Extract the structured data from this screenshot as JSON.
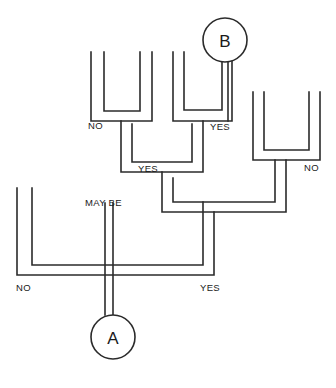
{
  "diagram": {
    "type": "decision-tree",
    "background_color": "#ffffff",
    "line_color": "#2b2b2b",
    "nodes": [
      {
        "id": "A",
        "label": "A",
        "cx": 113,
        "cy": 337,
        "r": 22
      },
      {
        "id": "B",
        "label": "B",
        "cx": 225,
        "cy": 40,
        "r": 22
      }
    ],
    "branch_labels": [
      {
        "id": "label-no-top-left",
        "text": "NO",
        "x": 88,
        "y": 129
      },
      {
        "id": "label-yes-top-right",
        "text": "YES",
        "x": 210,
        "y": 130
      },
      {
        "id": "label-yes-mid",
        "text": "YES",
        "x": 138,
        "y": 172
      },
      {
        "id": "label-no-mid-right",
        "text": "NO",
        "x": 304,
        "y": 171
      },
      {
        "id": "label-maybe",
        "text": "MAY BE",
        "x": 85,
        "y": 206
      },
      {
        "id": "label-no-bottom",
        "text": "NO",
        "x": 16,
        "y": 291
      },
      {
        "id": "label-yes-bottom",
        "text": "YES",
        "x": 200,
        "y": 291
      }
    ],
    "edges": [
      {
        "id": "bracket-1-outer",
        "d": "M 91,52 L 91,121 L 152,121 L 152,52"
      },
      {
        "id": "bracket-1-inner",
        "d": "M 104,52 L 104,111 L 140,111 L 140,52"
      },
      {
        "id": "bracket-2-outer",
        "d": "M 173,52 L 173,121 L 232,121 L 232,52"
      },
      {
        "id": "bracket-2-inner",
        "d": "M 184,52 L 184,110 L 222,110 L 222,60"
      },
      {
        "id": "bracket-3-outer",
        "d": "M 253,92 L 253,160 L 320,160 L 320,92"
      },
      {
        "id": "bracket-3-inner",
        "d": "M 264,92 L 264,150 L 309,150 L 309,92"
      },
      {
        "id": "merge-level2-outer",
        "d": "M 121,121 L 121,172 L 203,172 L 203,121"
      },
      {
        "id": "merge-level2-inner",
        "d": "M 132,131 L 132,162 L 192,162 L 192,131"
      },
      {
        "id": "merge-level3-outer",
        "d": "M 162,172 L 162,212 L 286,212 L 286,160"
      },
      {
        "id": "merge-level3-inner",
        "d": "M 173,182 L 173,202 L 275,202 L 275,160"
      },
      {
        "id": "bracket-bottom-outer",
        "d": "M 17,188 L 17,275 L 113,275"
      },
      {
        "id": "bracket-bottom-inner",
        "d": "M 32,188 L 32,265 L 105,265"
      },
      {
        "id": "bracket-bottom-right-outer",
        "d": "M 214,275 L 214,212"
      },
      {
        "id": "bracket-bottom-right-inner",
        "d": "M 203,265 L 203,202"
      },
      {
        "id": "main-bar-bottom",
        "d": "M 17,275 L 214,275"
      },
      {
        "id": "main-bar-inner",
        "d": "M 105,265 L 203,265"
      },
      {
        "id": "stem-maybe-left",
        "d": "M 105,265 L 105,315"
      },
      {
        "id": "stem-maybe-right",
        "d": "M 113,275 L 113,315"
      },
      {
        "id": "stem-b-left",
        "d": "M 222,60 L 222,110"
      },
      {
        "id": "stem-b-right",
        "d": "M 228,62 L 228,110"
      }
    ]
  }
}
